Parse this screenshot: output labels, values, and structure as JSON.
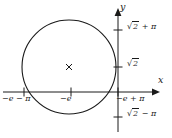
{
  "figure": {
    "type": "math-plot",
    "background_color": "#ffffff",
    "stroke_color": "#1a1a1a",
    "axes": {
      "x_axis_label": "x",
      "y_axis_label": "y",
      "origin_px": {
        "x": 118,
        "y": 92
      }
    },
    "x_ticks": [
      {
        "label_parts": {
          "lead": "−e",
          "op": " − ",
          "tail": "π"
        },
        "label": "−e − π"
      },
      {
        "label_parts": {
          "lead": "−e",
          "op": "",
          "tail": ""
        },
        "label": "−e"
      },
      {
        "label_parts": {
          "lead": "−e",
          "op": " + ",
          "tail": "π"
        },
        "label": "−e + π"
      }
    ],
    "y_ticks": [
      {
        "label": "√2 + π",
        "radical": "√",
        "radicand": "2",
        "op": " + ",
        "tail": "π"
      },
      {
        "label": "√2",
        "radical": "√",
        "radicand": "2",
        "op": "",
        "tail": ""
      },
      {
        "label": "√2 − π",
        "radical": "√",
        "radicand": "2",
        "op": " − ",
        "tail": "π"
      }
    ],
    "circle": {
      "center_marker": "×",
      "center_px": {
        "x": 69,
        "y": 67
      },
      "radius_px": 47
    }
  }
}
